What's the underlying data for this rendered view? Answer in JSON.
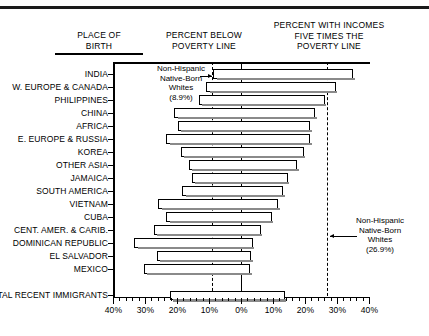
{
  "headers": {
    "place_of_birth": "PLACE OF\nBIRTH",
    "percent_below": "PERCENT BELOW\nPOVERTY LINE",
    "percent_income": "PERCENT WITH INCOMES\nFIVE TIMES THE\nPOVERTY LINE"
  },
  "annotations": {
    "left": {
      "line1": "Non-Hispanic",
      "line2": "Native-Born",
      "line3": "Whites",
      "line4": "(8.9%)",
      "value": 8.9
    },
    "right": {
      "line1": "Non-Hispanic",
      "line2": "Native-Born",
      "line3": "Whites",
      "line4": "(26.9%)",
      "value": 26.9
    }
  },
  "axis": {
    "ticks": [
      "40%",
      "30%",
      "20%",
      "10%",
      "0%",
      "10%",
      "20%",
      "30%",
      "40%"
    ],
    "tick_values": [
      -40,
      -30,
      -20,
      -10,
      0,
      10,
      20,
      30,
      40
    ],
    "min": -40,
    "max": 40
  },
  "chart_data": {
    "type": "bar",
    "title": "",
    "xlabel": "",
    "ylabel": "PLACE OF BIRTH",
    "xlim": [
      -40,
      40
    ],
    "grid": false,
    "legend": "none",
    "reference_lines": [
      {
        "label": "Non-Hispanic Native-Born Whites (8.9%)",
        "value": -8.9,
        "style": "dashed"
      },
      {
        "label": "Zero",
        "value": 0,
        "style": "solid"
      },
      {
        "label": "Non-Hispanic Native-Born Whites (26.9%)",
        "value": 26.9,
        "style": "dashed"
      }
    ],
    "categories": [
      "INDIA",
      "W. EUROPE & CANADA",
      "PHILIPPINES",
      "CHINA",
      "AFRICA",
      "E. EUROPE & RUSSIA",
      "KOREA",
      "OTHER ASIA",
      "JAMAICA",
      "SOUTH AMERICA",
      "VIETNAM",
      "CUBA",
      "CENT. AMER. & CARIB.",
      "DOMINICAN REPUBLIC",
      "EL SALVADOR",
      "MEXICO",
      "TOTAL RECENT IMMIGRANTS"
    ],
    "series": [
      {
        "name": "Percent below poverty line",
        "values": [
          8.8,
          11.0,
          13.3,
          21.0,
          20.0,
          23.5,
          19.0,
          16.5,
          15.5,
          18.5,
          26.0,
          23.5,
          27.5,
          33.5,
          26.5,
          30.5,
          22.5
        ]
      },
      {
        "name": "Percent with incomes five times the poverty line",
        "values": [
          35.0,
          29.5,
          26.0,
          23.0,
          21.5,
          21.5,
          19.5,
          17.5,
          14.5,
          13.0,
          11.5,
          9.5,
          6.0,
          3.5,
          3.0,
          2.8,
          13.5
        ]
      }
    ]
  }
}
